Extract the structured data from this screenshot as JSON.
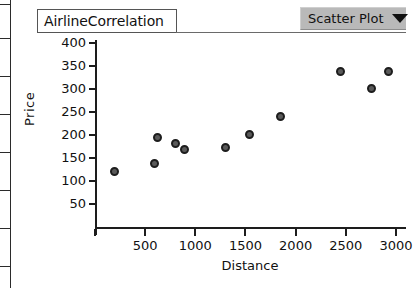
{
  "window": {
    "title_field_value": "AirlineCorrelation"
  },
  "toolbar": {
    "plot_type_dropdown": {
      "label": "Scatter Plot",
      "caret_icon": "chevron-down-icon"
    }
  },
  "colors": {
    "axis": "#1d1d1d",
    "point_fill": "#5a5a5a",
    "point_stroke": "#1d1d1d",
    "dropdown_bg": "#b9b9b9",
    "page_bg": "#ffffff"
  },
  "chart_data": {
    "type": "scatter",
    "title": "AirlineCorrelation",
    "xlabel": "Distance",
    "ylabel": "Price",
    "xlim": [
      0,
      3100
    ],
    "ylim": [
      0,
      420
    ],
    "xticks": [
      500,
      1000,
      1500,
      2000,
      2500,
      3000
    ],
    "yticks": [
      50,
      100,
      150,
      200,
      250,
      300,
      350,
      400
    ],
    "xtick_labels": [
      "500",
      "1000",
      "1500",
      "2000",
      "2500",
      "3000"
    ],
    "ytick_labels": [
      "50",
      "100",
      "150",
      "200",
      "250",
      "300",
      "350",
      "400"
    ],
    "grid": false,
    "legend": null,
    "series": [
      {
        "name": "Airline fares",
        "marker": "open-circle",
        "points": [
          {
            "x": 195,
            "y": 120
          },
          {
            "x": 595,
            "y": 138
          },
          {
            "x": 625,
            "y": 195
          },
          {
            "x": 800,
            "y": 182
          },
          {
            "x": 890,
            "y": 168
          },
          {
            "x": 1300,
            "y": 172
          },
          {
            "x": 1545,
            "y": 202
          },
          {
            "x": 1850,
            "y": 240
          },
          {
            "x": 2450,
            "y": 338
          },
          {
            "x": 2760,
            "y": 302
          },
          {
            "x": 2930,
            "y": 338
          }
        ]
      }
    ]
  }
}
